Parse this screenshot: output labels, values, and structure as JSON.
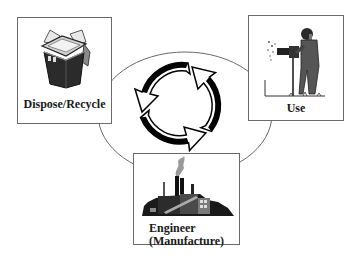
{
  "diagram": {
    "type": "product-lifecycle-cycle",
    "center": {
      "shape": "ellipse",
      "symbol": "recycle-arrows-icon",
      "arrow_count": 3,
      "direction": "clockwise"
    },
    "nodes": [
      {
        "id": "dispose",
        "label": "Dispose/Recycle",
        "icon": "trash-bin-icon",
        "position": "top-left"
      },
      {
        "id": "use",
        "label": "Use",
        "icon": "worker-with-drill-icon",
        "position": "top-right"
      },
      {
        "id": "engineer",
        "label_line1": "Engineer",
        "label_line2": "(Manufacture)",
        "icon": "factory-icon",
        "position": "bottom-center"
      }
    ],
    "colors": {
      "background": "#ffffff",
      "box_border": "#6a6a6a",
      "ellipse_stroke": "#6a6a6a",
      "arrow_fill": "#000000",
      "text": "#1a1a1a"
    }
  }
}
